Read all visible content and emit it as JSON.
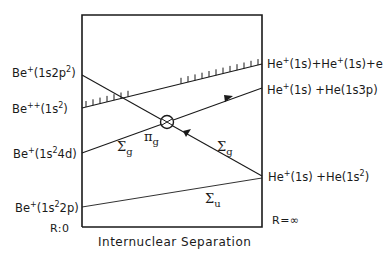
{
  "diagram": {
    "x_axis": {
      "label": "Internuclear Separation",
      "left": "R:0",
      "right": "R=∞"
    },
    "left_states": [
      {
        "id": "be_1s2p2",
        "species": "Be",
        "charge": "+",
        "config": "(1s2p",
        "config_sup": "2",
        "config_end": ")"
      },
      {
        "id": "be_1s2",
        "species": "Be",
        "charge": "++",
        "config": "(1s",
        "config_sup": "2",
        "config_end": ")"
      },
      {
        "id": "be_1s24d",
        "species": "Be",
        "charge": "+",
        "config": "(1s",
        "config_sup": "2",
        "config_end": "4d)"
      },
      {
        "id": "be_1s22p",
        "species": "Be",
        "charge": "+",
        "config": "(1s",
        "config_sup": "2",
        "config_end": "2p)"
      }
    ],
    "right_states": [
      {
        "id": "ionized",
        "text_a": "He",
        "sup_a": "+",
        "mid": "(1s)+He",
        "sup_b": "+",
        "end": "(1s)+e"
      },
      {
        "id": "excited",
        "text_a": "He",
        "sup_a": "+",
        "mid": "(1s) +He(1s3p)",
        "sup_b": "",
        "end": ""
      },
      {
        "id": "ground",
        "text_a": "He",
        "sup_a": "+",
        "mid": "(1s) +He(1s",
        "sup_b": "2",
        "end": ")"
      }
    ],
    "curve_labels": {
      "sigma_g_left": "Σ",
      "sigma_g_left_sub": "g",
      "pi_g": "π",
      "pi_g_sub": "g",
      "sigma_g_right": "Σ",
      "sigma_g_right_sub": "g",
      "sigma_u": "Σ",
      "sigma_u_sub": "u"
    },
    "colors": {
      "ink": "#1a1a1a",
      "background": "#ffffff"
    }
  }
}
